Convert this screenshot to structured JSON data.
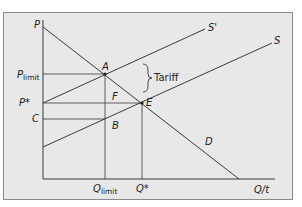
{
  "diagram": {
    "type": "supply-demand-tariff",
    "axes": {
      "y_label": "P",
      "x_label": "Q/t"
    },
    "curves": {
      "demand": "D",
      "supply": "S",
      "supply_with_tariff": "S'"
    },
    "points": {
      "a": "A",
      "e": "E",
      "f": "F",
      "b": "B"
    },
    "price_labels": {
      "p_limit_main": "P",
      "p_limit_sub": "limit",
      "p_star": "P*",
      "c": "C"
    },
    "quantity_labels": {
      "q_limit_main": "Q",
      "q_limit_sub": "limit",
      "q_star": "Q*"
    },
    "annotation": {
      "tariff": "Tariff"
    },
    "colors": {
      "background": "#e8e8e8",
      "line": "#3a3a3a",
      "frame": "#8a8a8a"
    }
  }
}
